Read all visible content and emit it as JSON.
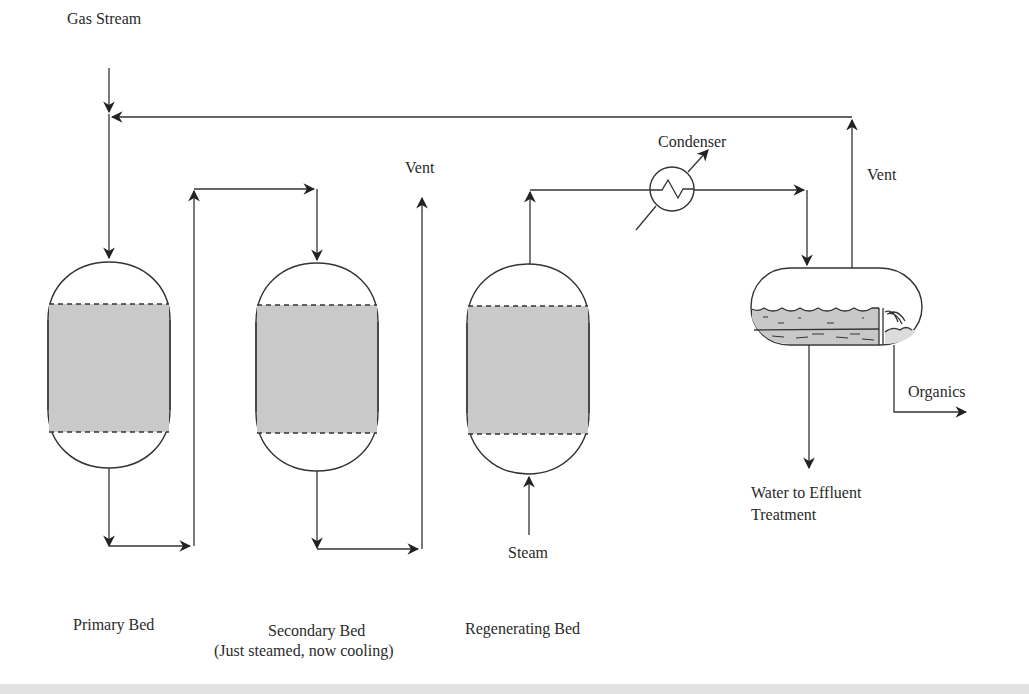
{
  "diagram": {
    "type": "process-flow",
    "labels": {
      "gas_stream": "Gas Stream",
      "vent_secondary": "Vent",
      "condenser": "Condenser",
      "vent_separator": "Vent",
      "organics": "Organics",
      "water_line1": "Water to Effluent",
      "water_line2": "Treatment",
      "steam": "Steam",
      "primary_bed": "Primary Bed",
      "secondary_bed_line1": "Secondary Bed",
      "secondary_bed_line2": "(Just steamed, now cooling)",
      "regenerating_bed": "Regenerating Bed"
    },
    "colors": {
      "line": "#333333",
      "bed_fill": "#c9c9c9",
      "background": "#ffffff"
    },
    "nodes": [
      {
        "id": "primary-bed",
        "label": "Primary Bed"
      },
      {
        "id": "secondary-bed",
        "label": "Secondary Bed (Just steamed, now cooling)"
      },
      {
        "id": "regenerating-bed",
        "label": "Regenerating Bed"
      },
      {
        "id": "condenser",
        "label": "Condenser"
      },
      {
        "id": "separator",
        "label": "Decanter / Separator"
      }
    ],
    "edges": [
      {
        "from": "Gas Stream",
        "to": "primary-bed"
      },
      {
        "from": "primary-bed",
        "to": "secondary-bed"
      },
      {
        "from": "secondary-bed",
        "to": "Vent"
      },
      {
        "from": "Steam",
        "to": "regenerating-bed"
      },
      {
        "from": "regenerating-bed",
        "to": "condenser"
      },
      {
        "from": "condenser",
        "to": "separator"
      },
      {
        "from": "separator",
        "to": "Vent (recycled to gas stream)"
      },
      {
        "from": "separator",
        "to": "Organics"
      },
      {
        "from": "separator",
        "to": "Water to Effluent Treatment"
      }
    ]
  }
}
